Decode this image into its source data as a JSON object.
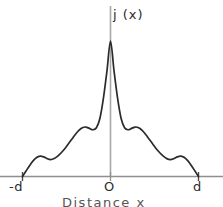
{
  "figure": {
    "type": "line-plot",
    "background": "#ffffff",
    "ink_color": "#2b2b2b",
    "axis_color": "#9a9a9a"
  },
  "labels": {
    "ylabel": "j (x)",
    "xlabel": "Distance x",
    "tick_left": "-d",
    "tick_center": "O",
    "tick_right": "d"
  },
  "chart_data": {
    "type": "line",
    "title": "",
    "subtitle": "",
    "xlabel": "Distance x",
    "ylabel": "j (x)",
    "xlim": [
      -1,
      1
    ],
    "ylim": [
      0,
      1
    ],
    "grid": false,
    "legend": null,
    "xticks": [
      -1,
      0,
      1
    ],
    "xticklabels": [
      "-d",
      "O",
      "d"
    ],
    "yticks": [],
    "yticklabels": [],
    "annotations": [
      "central maximum at x = 0",
      "first side lobes either side of the central peak",
      "second side lobes nearer to -d and d",
      "curve meets the axis at -d and d"
    ],
    "series": [
      {
        "name": "j(x)",
        "color": "#2b2b2b",
        "x": [
          -1.0,
          -0.96,
          -0.92,
          -0.88,
          -0.84,
          -0.8,
          -0.76,
          -0.72,
          -0.68,
          -0.64,
          -0.6,
          -0.56,
          -0.52,
          -0.48,
          -0.44,
          -0.4,
          -0.36,
          -0.32,
          -0.28,
          -0.24,
          -0.2,
          -0.16,
          -0.12,
          -0.08,
          -0.04,
          0.0,
          0.04,
          0.08,
          0.12,
          0.16,
          0.2,
          0.24,
          0.28,
          0.32,
          0.36,
          0.4,
          0.44,
          0.48,
          0.52,
          0.56,
          0.6,
          0.64,
          0.68,
          0.72,
          0.76,
          0.8,
          0.84,
          0.88,
          0.92,
          0.96,
          1.0
        ],
        "y": [
          0.0,
          0.04,
          0.08,
          0.115,
          0.14,
          0.15,
          0.145,
          0.132,
          0.125,
          0.132,
          0.15,
          0.175,
          0.205,
          0.24,
          0.275,
          0.31,
          0.34,
          0.36,
          0.365,
          0.355,
          0.345,
          0.36,
          0.43,
          0.58,
          0.78,
          1.0,
          0.78,
          0.58,
          0.43,
          0.36,
          0.345,
          0.355,
          0.365,
          0.36,
          0.34,
          0.31,
          0.275,
          0.24,
          0.205,
          0.175,
          0.15,
          0.132,
          0.125,
          0.132,
          0.145,
          0.15,
          0.14,
          0.115,
          0.08,
          0.04,
          0.0
        ]
      }
    ]
  }
}
